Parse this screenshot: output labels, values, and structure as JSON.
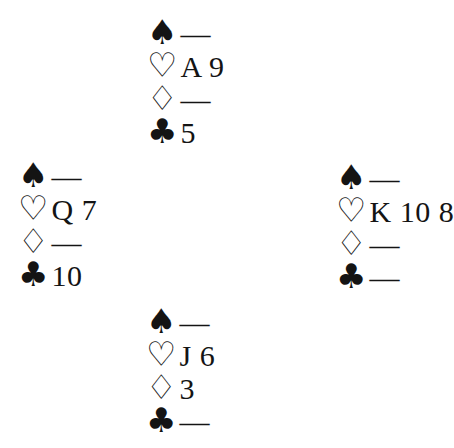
{
  "page": {
    "background_color": "#ffffff",
    "ink_color": "#141414"
  },
  "suits": {
    "spades": {
      "symbol": "♠",
      "style": "filled"
    },
    "hearts": {
      "symbol": "♡",
      "style": "outline"
    },
    "diamonds": {
      "symbol": "♢",
      "style": "outline"
    },
    "clubs": {
      "symbol": "♣",
      "style": "filled"
    }
  },
  "void_marker": "—",
  "hands": {
    "north": {
      "seat": "North",
      "spades": "—",
      "hearts": "A 9",
      "diamonds": "—",
      "clubs": "5"
    },
    "west": {
      "seat": "West",
      "spades": "—",
      "hearts": "Q 7",
      "diamonds": "—",
      "clubs": "10"
    },
    "east": {
      "seat": "East",
      "spades": "—",
      "hearts": "K 10 8",
      "diamonds": "—",
      "clubs": "—"
    },
    "south": {
      "seat": "South",
      "spades": "—",
      "hearts": "J 6",
      "diamonds": "3",
      "clubs": "—"
    }
  }
}
